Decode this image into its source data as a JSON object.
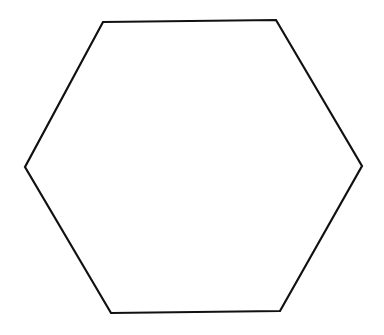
{
  "canvas": {
    "width": 384,
    "height": 335,
    "background": "#ffffff"
  },
  "shape": {
    "type": "hexagon",
    "stroke": "#111111",
    "stroke_width": 2.2,
    "fill": "none",
    "vertices": [
      [
        103,
        22
      ],
      [
        276,
        20
      ],
      [
        362,
        166
      ],
      [
        280,
        311
      ],
      [
        111,
        313
      ],
      [
        25,
        167
      ]
    ]
  }
}
